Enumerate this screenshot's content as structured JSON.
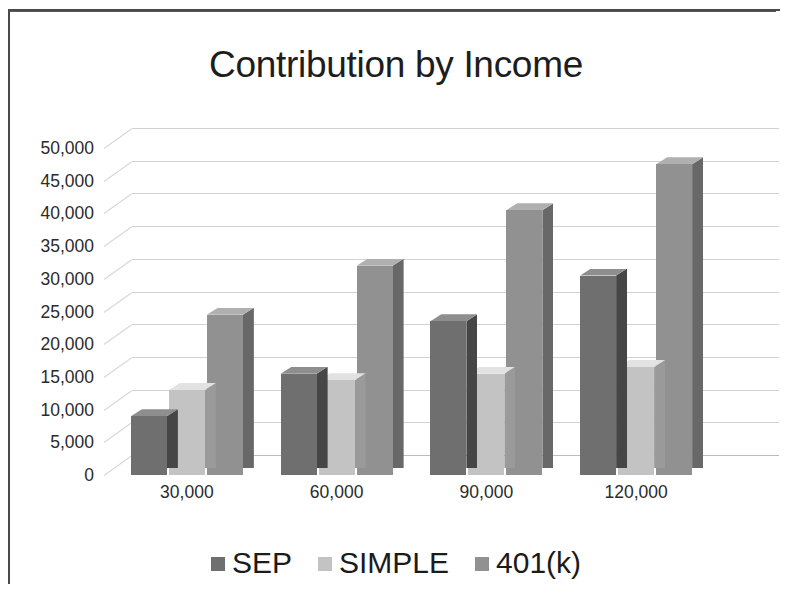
{
  "chart_data": {
    "type": "bar",
    "title": "Contribution by Income",
    "xlabel": "",
    "ylabel": "",
    "categories": [
      "30,000",
      "60,000",
      "90,000",
      "120,000"
    ],
    "series": [
      {
        "name": "SEP",
        "color": "#6f6f6f",
        "values": [
          9000,
          15500,
          23500,
          30500
        ]
      },
      {
        "name": "SIMPLE",
        "color": "#c3c3c3",
        "values": [
          13000,
          14500,
          15500,
          16500
        ]
      },
      {
        "name": "401(k)",
        "color": "#919191",
        "values": [
          24500,
          32000,
          40500,
          47500
        ]
      }
    ],
    "ylim": [
      0,
      50000
    ],
    "ytick_values": [
      50000,
      45000,
      40000,
      35000,
      30000,
      25000,
      20000,
      15000,
      10000,
      5000,
      0
    ],
    "ytick_labels": [
      "50,000",
      "45,000",
      "40,000",
      "35,000",
      "30,000",
      "25,000",
      "20,000",
      "15,000",
      "10,000",
      "5,000",
      "0"
    ],
    "grid": true,
    "legend_position": "bottom",
    "three_d": true
  },
  "legend": {
    "items": [
      {
        "label": "SEP",
        "color": "#6f6f6f"
      },
      {
        "label": "SIMPLE",
        "color": "#c3c3c3"
      },
      {
        "label": "401(k)",
        "color": "#919191"
      }
    ]
  },
  "colors": {
    "background": "#ffffff",
    "text": "#1d1d1d",
    "gridline": "#d2d2d2",
    "frame": "#4a4a4a"
  }
}
